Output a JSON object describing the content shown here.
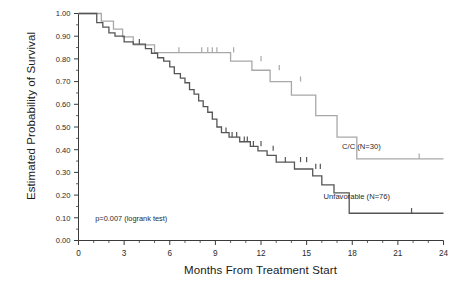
{
  "chart_data": {
    "type": "line",
    "title": "",
    "xlabel": "Months From Treatment Start",
    "ylabel": "Estimated Probability of Survival",
    "xlim": [
      0,
      24
    ],
    "ylim": [
      0.0,
      1.0
    ],
    "grid": false,
    "legend_position": "inline-right",
    "xticks": [
      "0",
      "3",
      "6",
      "9",
      "12",
      "15",
      "18",
      "21",
      "24"
    ],
    "xtick_values": [
      0,
      3,
      6,
      9,
      12,
      15,
      18,
      21,
      24
    ],
    "xminor_interval": 1,
    "yticks": [
      "0.00",
      "0.10",
      "0.20",
      "0.30",
      "0.40",
      "0.50",
      "0.60",
      "0.70",
      "0.80",
      "0.90",
      "1.00"
    ],
    "ytick_values": [
      0.0,
      0.1,
      0.2,
      0.3,
      0.4,
      0.5,
      0.6,
      0.7,
      0.8,
      0.9,
      1.0
    ],
    "annotations": [
      {
        "text": "p=0.007 (logrank test)",
        "x": 1.1,
        "y": 0.085
      }
    ],
    "series": [
      {
        "name": "C/C (N=30)",
        "label": "C/C (N=30)",
        "color": "#a8a8a8",
        "n": 30,
        "label_x": 18.6,
        "label_y": 0.405,
        "steps": [
          [
            0.0,
            1.0
          ],
          [
            1.5,
            1.0
          ],
          [
            1.5,
            0.966
          ],
          [
            2.3,
            0.966
          ],
          [
            2.3,
            0.931
          ],
          [
            2.9,
            0.931
          ],
          [
            2.9,
            0.897
          ],
          [
            3.6,
            0.897
          ],
          [
            3.6,
            0.862
          ],
          [
            5.0,
            0.862
          ],
          [
            5.0,
            0.828
          ],
          [
            10.0,
            0.828
          ],
          [
            10.0,
            0.79
          ],
          [
            11.4,
            0.79
          ],
          [
            11.4,
            0.75
          ],
          [
            12.6,
            0.75
          ],
          [
            12.6,
            0.7
          ],
          [
            14.0,
            0.7
          ],
          [
            14.0,
            0.64
          ],
          [
            15.6,
            0.64
          ],
          [
            15.6,
            0.55
          ],
          [
            17.0,
            0.55
          ],
          [
            17.0,
            0.455
          ],
          [
            18.3,
            0.455
          ],
          [
            18.3,
            0.36
          ],
          [
            24.0,
            0.36
          ]
        ],
        "censors": [
          [
            6.6,
            0.828
          ],
          [
            8.1,
            0.828
          ],
          [
            8.5,
            0.828
          ],
          [
            8.8,
            0.828
          ],
          [
            9.1,
            0.828
          ],
          [
            10.2,
            0.828
          ],
          [
            12.0,
            0.79
          ],
          [
            13.2,
            0.75
          ],
          [
            14.6,
            0.7
          ],
          [
            22.4,
            0.36
          ]
        ]
      },
      {
        "name": "Unfavorable (N=76)",
        "label": "Unfavorable (N=76)",
        "color": "#555555",
        "n": 76,
        "label_x": 18.3,
        "label_y": 0.185,
        "steps": [
          [
            0.0,
            1.0
          ],
          [
            1.2,
            1.0
          ],
          [
            1.2,
            0.96
          ],
          [
            1.6,
            0.96
          ],
          [
            1.6,
            0.94
          ],
          [
            2.0,
            0.94
          ],
          [
            2.0,
            0.915
          ],
          [
            2.4,
            0.915
          ],
          [
            2.4,
            0.9
          ],
          [
            3.0,
            0.9
          ],
          [
            3.0,
            0.875
          ],
          [
            3.6,
            0.875
          ],
          [
            3.6,
            0.865
          ],
          [
            4.4,
            0.865
          ],
          [
            4.4,
            0.845
          ],
          [
            4.8,
            0.845
          ],
          [
            4.8,
            0.825
          ],
          [
            5.2,
            0.825
          ],
          [
            5.2,
            0.805
          ],
          [
            5.6,
            0.805
          ],
          [
            5.6,
            0.79
          ],
          [
            6.0,
            0.79
          ],
          [
            6.0,
            0.765
          ],
          [
            6.3,
            0.765
          ],
          [
            6.3,
            0.735
          ],
          [
            6.7,
            0.735
          ],
          [
            6.7,
            0.715
          ],
          [
            7.0,
            0.715
          ],
          [
            7.0,
            0.695
          ],
          [
            7.3,
            0.695
          ],
          [
            7.3,
            0.665
          ],
          [
            7.6,
            0.665
          ],
          [
            7.6,
            0.645
          ],
          [
            7.9,
            0.645
          ],
          [
            7.9,
            0.615
          ],
          [
            8.2,
            0.615
          ],
          [
            8.2,
            0.59
          ],
          [
            8.5,
            0.59
          ],
          [
            8.5,
            0.565
          ],
          [
            8.8,
            0.565
          ],
          [
            8.8,
            0.535
          ],
          [
            9.1,
            0.535
          ],
          [
            9.1,
            0.5
          ],
          [
            9.4,
            0.5
          ],
          [
            9.4,
            0.475
          ],
          [
            9.9,
            0.475
          ],
          [
            9.9,
            0.455
          ],
          [
            10.6,
            0.455
          ],
          [
            10.6,
            0.435
          ],
          [
            11.3,
            0.435
          ],
          [
            11.3,
            0.415
          ],
          [
            11.8,
            0.415
          ],
          [
            11.8,
            0.395
          ],
          [
            12.4,
            0.395
          ],
          [
            12.4,
            0.375
          ],
          [
            13.0,
            0.375
          ],
          [
            13.0,
            0.345
          ],
          [
            14.2,
            0.345
          ],
          [
            14.2,
            0.315
          ],
          [
            15.4,
            0.315
          ],
          [
            15.4,
            0.285
          ],
          [
            16.0,
            0.285
          ],
          [
            16.0,
            0.245
          ],
          [
            16.8,
            0.245
          ],
          [
            16.8,
            0.21
          ],
          [
            17.8,
            0.21
          ],
          [
            17.8,
            0.12
          ],
          [
            24.0,
            0.12
          ]
        ],
        "censors": [
          [
            4.0,
            0.865
          ],
          [
            9.7,
            0.475
          ],
          [
            10.1,
            0.455
          ],
          [
            10.4,
            0.455
          ],
          [
            10.9,
            0.435
          ],
          [
            11.1,
            0.435
          ],
          [
            11.5,
            0.415
          ],
          [
            12.0,
            0.415
          ],
          [
            12.8,
            0.395
          ],
          [
            13.6,
            0.345
          ],
          [
            14.6,
            0.345
          ],
          [
            15.0,
            0.345
          ],
          [
            15.6,
            0.315
          ],
          [
            15.9,
            0.315
          ],
          [
            21.9,
            0.12
          ]
        ]
      }
    ]
  },
  "axes": {
    "x_label": "Months From Treatment Start",
    "y_label": "Estimated Probability of Survival"
  },
  "annotation": {
    "pvalue": "p=0.007 (logrank test)"
  },
  "legend": {
    "series_a": "C/C (N=30)",
    "series_b": "Unfavorable (N=76)"
  },
  "colors": {
    "series_a": "#a8a8a8",
    "series_b": "#555555",
    "axis": "#3a3a3a",
    "text": "#1a1a1a",
    "background": "#ffffff"
  }
}
